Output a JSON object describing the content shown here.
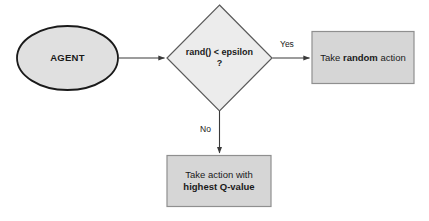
{
  "diagram": {
    "colors": {
      "background": "#ffffff",
      "ellipse_fill": "#e0e0e0",
      "ellipse_stroke": "#1a1a1a",
      "diamond_fill": "#ececec",
      "diamond_stroke": "#555555",
      "box_fill": "#d6d6d6",
      "box_stroke": "#8a8a8a",
      "arrow_stroke": "#3a3a3a",
      "text": "#1a1a1a"
    },
    "nodes": {
      "agent": {
        "shape": "ellipse",
        "label": "AGENT"
      },
      "decision": {
        "shape": "diamond",
        "line1": "rand() < epsilon",
        "line2": "?"
      },
      "random_action": {
        "shape": "rectangle",
        "prefix": "Take ",
        "emphasis": "random",
        "suffix": " action"
      },
      "greedy_action": {
        "shape": "rectangle",
        "line1": "Take action with",
        "line2": "highest Q-value"
      }
    },
    "edges": {
      "agent_to_decision": {
        "label": ""
      },
      "decision_to_random": {
        "label": "Yes"
      },
      "decision_to_greedy": {
        "label": "No"
      }
    }
  }
}
